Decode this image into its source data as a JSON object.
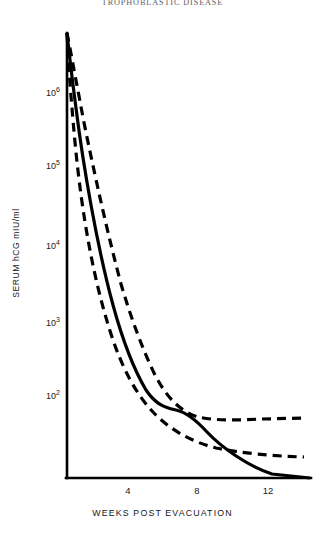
{
  "figure": {
    "title": "TROPHOBLASTIC DISEASE"
  },
  "axes": {
    "y_label": "SERUM hCG mIU/ml",
    "x_label": "WEEKS POST EVACUATION",
    "y_ticks": [
      {
        "mantissa": "10",
        "exponent": "6",
        "value": 1000000
      },
      {
        "mantissa": "10",
        "exponent": "5",
        "value": 100000
      },
      {
        "mantissa": "10",
        "exponent": "4",
        "value": 10000
      },
      {
        "mantissa": "10",
        "exponent": "3",
        "value": 1000
      },
      {
        "mantissa": "10",
        "exponent": "2",
        "value": 100
      }
    ],
    "x_ticks": [
      {
        "label": "4",
        "value": 4
      },
      {
        "label": "8",
        "value": 8
      },
      {
        "label": "12",
        "value": 12
      }
    ]
  },
  "colors": {
    "ink": "#111111",
    "axis": "#000000",
    "curve": "#000000"
  },
  "chart_data": {
    "type": "line",
    "title": "TROPHOBLASTIC DISEASE",
    "xlabel": "WEEKS POST EVACUATION",
    "ylabel": "SERUM hCG mIU/ml",
    "yscale": "log",
    "ylim": [
      100,
      4000000
    ],
    "xlim": [
      0,
      14
    ],
    "grid": false,
    "legend": "none",
    "series": [
      {
        "name": "Mean regression (solid)",
        "style": "solid",
        "x": [
          0.0,
          0.3,
          0.8,
          1.4,
          2.0,
          2.7,
          3.4,
          4.2,
          5.0,
          5.8,
          6.6,
          7.4,
          8.0,
          8.6,
          9.4,
          10.2,
          11.0,
          11.8,
          12.5,
          13.2,
          13.9
        ],
        "y": [
          170,
          2600000,
          900000,
          330000,
          140000,
          62000,
          28000,
          13500,
          7000,
          3800,
          2100,
          1250,
          900,
          720,
          500,
          350,
          250,
          185,
          150,
          125,
          100
        ]
      },
      {
        "name": "Upper 95% confidence limit (dashed)",
        "style": "dashed",
        "x": [
          0.0,
          0.3,
          0.9,
          1.6,
          2.4,
          3.2,
          4.1,
          5.0,
          6.0,
          7.0,
          8.0,
          9.0,
          10.0,
          11.0,
          12.0,
          13.0,
          13.9
        ],
        "y": [
          220,
          2900000,
          1150000,
          480000,
          215000,
          105000,
          52000,
          27000,
          14000,
          8000,
          4700,
          3000,
          2050,
          1500,
          1200,
          1060,
          1000
        ]
      },
      {
        "name": "Lower 95% confidence limit (dashed)",
        "style": "dashed",
        "x": [
          0.0,
          0.3,
          0.9,
          1.6,
          2.4,
          3.2,
          4.0,
          4.8,
          5.6,
          6.5,
          7.5,
          8.5,
          9.5,
          10.5,
          11.5,
          12.5,
          13.9
        ],
        "y": [
          130,
          1300000,
          320000,
          88000,
          27000,
          10000,
          4400,
          2200,
          1250,
          760,
          480,
          340,
          270,
          225,
          200,
          185,
          175
        ]
      }
    ]
  }
}
